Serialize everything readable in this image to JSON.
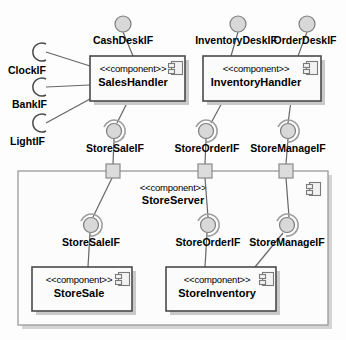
{
  "diagram": {
    "type": "uml-component-diagram",
    "stereotype_label": "<<component>>",
    "colors": {
      "background": "#fdfdfd",
      "component_fill": "#fbfbfb",
      "component_stroke": "#4a4a4a",
      "server_stroke": "#9a9a9a",
      "connector": "#666666",
      "ball_fill": "#d8d8d8",
      "port_fill": "#dcdcdc"
    }
  },
  "components": [
    {
      "id": "sales-handler",
      "stereotype": "<<component>>",
      "name": "SalesHandler",
      "x": 90,
      "y": 56,
      "w": 95,
      "h": 45
    },
    {
      "id": "inventory-handler",
      "stereotype": "<<component>>",
      "name": "InventoryHandler",
      "x": 203,
      "y": 56,
      "w": 118,
      "h": 45
    },
    {
      "id": "store-server",
      "stereotype": "<<component>>",
      "name": "StoreServer",
      "x": 18,
      "y": 171,
      "w": 310,
      "h": 154
    },
    {
      "id": "store-sale",
      "stereotype": "<<component>>",
      "name": "StoreSale",
      "x": 32,
      "y": 267,
      "w": 100,
      "h": 44
    },
    {
      "id": "store-inventory",
      "stereotype": "<<component>>",
      "name": "StoreInventory",
      "x": 166,
      "y": 267,
      "w": 110,
      "h": 44
    }
  ],
  "provided_interfaces": [
    {
      "id": "cash-desk-if",
      "label": "CashDeskIF",
      "cx": 123,
      "cy": 24,
      "label_x": 123,
      "label_y": 44
    },
    {
      "id": "inventory-desk-if",
      "label": "InventoryDeskIF",
      "cx": 238,
      "cy": 24,
      "label_x": 236,
      "label_y": 44
    },
    {
      "id": "order-desk-if",
      "label": "OrderDeskIF",
      "cx": 307,
      "cy": 24,
      "label_x": 305,
      "label_y": 44
    }
  ],
  "required_interfaces": [
    {
      "id": "clock-if",
      "label": "ClockIF",
      "cx": 40,
      "cy": 52,
      "label_x": 8,
      "label_y": 74
    },
    {
      "id": "bank-if",
      "label": "BankIF",
      "cx": 40,
      "cy": 87,
      "label_x": 12,
      "label_y": 108
    },
    {
      "id": "light-if",
      "label": "LightIF",
      "cx": 40,
      "cy": 123,
      "label_x": 10,
      "label_y": 145
    }
  ],
  "assembly_interfaces_upper": [
    {
      "id": "store-sale-if-upper",
      "label": "StoreSaleIF",
      "cx": 115,
      "cy": 131,
      "label_x": 115,
      "label_y": 152
    },
    {
      "id": "store-order-if-upper",
      "label": "StoreOrderIF",
      "cx": 207,
      "cy": 131,
      "label_x": 207,
      "label_y": 152
    },
    {
      "id": "store-manage-if-upper",
      "label": "StoreManageIF",
      "cx": 288,
      "cy": 131,
      "label_x": 288,
      "label_y": 152
    }
  ],
  "assembly_interfaces_lower": [
    {
      "id": "store-sale-if-lower",
      "label": "StoreSaleIF",
      "cx": 91,
      "cy": 225,
      "label_x": 91,
      "label_y": 246
    },
    {
      "id": "store-order-if-lower",
      "label": "StoreOrderIF",
      "cx": 208,
      "cy": 225,
      "label_x": 208,
      "label_y": 246
    },
    {
      "id": "store-manage-if-lower",
      "label": "StoreManageIF",
      "cx": 287,
      "cy": 225,
      "label_x": 287,
      "label_y": 246
    }
  ],
  "ports": [
    {
      "id": "port-store-sale",
      "x": 107,
      "y": 164
    },
    {
      "id": "port-store-order",
      "x": 199,
      "y": 164
    },
    {
      "id": "port-store-manage",
      "x": 280,
      "y": 164
    }
  ],
  "connectors": [
    {
      "id": "conn-clockif-sales",
      "from": "clock-if",
      "to": "sales-handler"
    },
    {
      "id": "conn-bankif-sales",
      "from": "bank-if",
      "to": "sales-handler"
    },
    {
      "id": "conn-lightif-sales",
      "from": "light-if",
      "to": "sales-handler"
    },
    {
      "id": "conn-cashdeskif-sales",
      "from": "cash-desk-if",
      "to": "sales-handler"
    },
    {
      "id": "conn-inventorydeskif-inv",
      "from": "inventory-desk-if",
      "to": "inventory-handler"
    },
    {
      "id": "conn-orderdeskif-inv",
      "from": "order-desk-if",
      "to": "inventory-handler"
    },
    {
      "id": "conn-sales-storesaleif",
      "from": "sales-handler",
      "to": "store-sale-if-upper"
    },
    {
      "id": "conn-inv-storeorderif",
      "from": "inventory-handler",
      "to": "store-order-if-upper"
    },
    {
      "id": "conn-inv-storemanageif",
      "from": "inventory-handler",
      "to": "store-manage-if-upper"
    },
    {
      "id": "conn-storesaleif-port",
      "from": "store-sale-if-upper",
      "to": "port-store-sale"
    },
    {
      "id": "conn-storeorderif-port",
      "from": "store-order-if-upper",
      "to": "port-store-order"
    },
    {
      "id": "conn-storemanageif-port",
      "from": "store-manage-if-upper",
      "to": "port-store-manage"
    },
    {
      "id": "conn-port-storesaleif-lower",
      "from": "port-store-sale",
      "to": "store-sale-if-lower"
    },
    {
      "id": "conn-port-storeorderif-lower",
      "from": "port-store-order",
      "to": "store-order-if-lower"
    },
    {
      "id": "conn-port-storemanageif-lower",
      "from": "port-store-manage",
      "to": "store-manage-if-lower"
    },
    {
      "id": "conn-storesaleif-storesale",
      "from": "store-sale-if-lower",
      "to": "store-sale"
    },
    {
      "id": "conn-storeorderif-storeinv",
      "from": "store-order-if-lower",
      "to": "store-inventory"
    },
    {
      "id": "conn-storemanageif-storeinv",
      "from": "store-manage-if-lower",
      "to": "store-inventory"
    }
  ]
}
